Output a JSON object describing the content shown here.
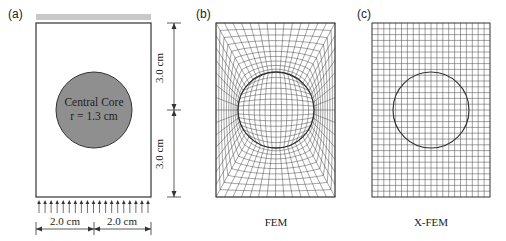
{
  "figure": {
    "panels": [
      {
        "id": "a",
        "label": "(a)",
        "core_label_line1": "Central Core",
        "core_label_line2": "r = 1.3 cm",
        "dimension_top": "3.0 cm",
        "dimension_bottom": "3.0 cm",
        "dimension_left": "2.0 cm",
        "dimension_right": "2.0 cm",
        "load_arrow_count": 19
      },
      {
        "id": "b",
        "label": "(b)",
        "caption": "FEM",
        "mesh_type": "body-fitted structured mesh"
      },
      {
        "id": "c",
        "label": "(c)",
        "caption": "X-FEM",
        "mesh_type": "uniform structured mesh",
        "grid_columns": 20,
        "grid_rows": 30
      }
    ],
    "colors": {
      "line": "#333333",
      "core_fill": "#8f8f8f",
      "top_bar": "#c8c8c8",
      "mesh": "#444444"
    }
  }
}
